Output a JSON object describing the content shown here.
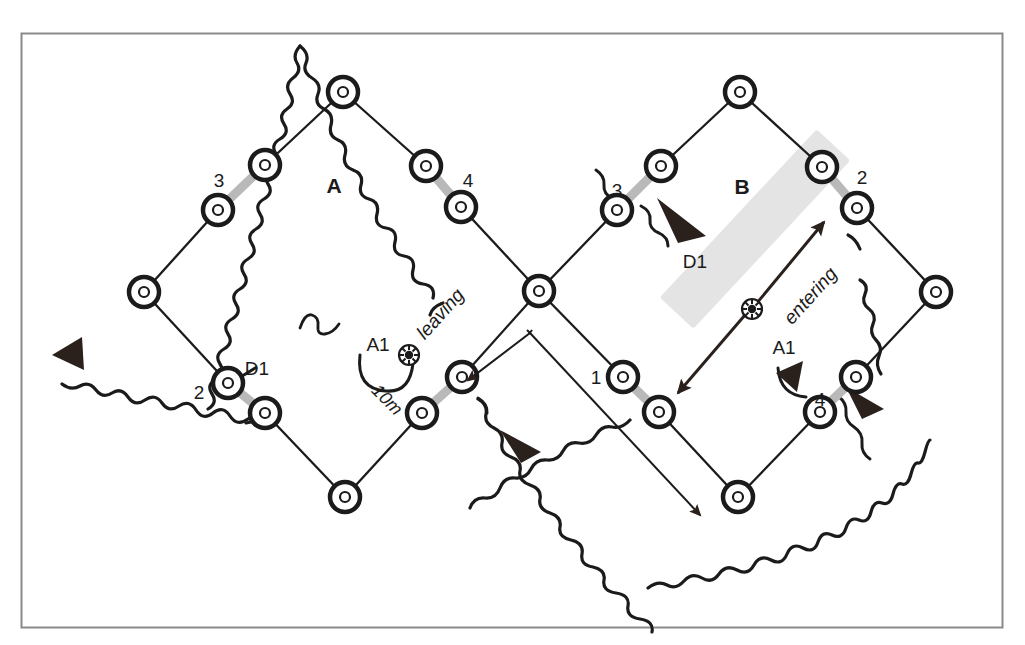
{
  "figure": {
    "frame_color": "#8a8a8a",
    "background": "#ffffff",
    "ink_color": "#1b1b1b",
    "gate_color": "#b9b9b9",
    "band_color": "#e2e2e2"
  },
  "regions": [
    {
      "id": "A",
      "label": "A",
      "x": 334,
      "y": 186
    },
    {
      "id": "B",
      "label": "B",
      "x": 742,
      "y": 187
    }
  ],
  "gate_labels": [
    {
      "label": "3",
      "x": 219,
      "y": 180,
      "region": "A"
    },
    {
      "label": "4",
      "x": 468,
      "y": 180,
      "region": "A"
    },
    {
      "label": "2",
      "x": 199,
      "y": 392,
      "region": "A"
    },
    {
      "label": "3",
      "x": 617,
      "y": 190,
      "region": "B"
    },
    {
      "label": "2",
      "x": 862,
      "y": 177,
      "region": "B"
    },
    {
      "label": "1",
      "x": 596,
      "y": 377,
      "region": "B"
    },
    {
      "label": "4",
      "x": 820,
      "y": 399,
      "region": "B"
    }
  ],
  "annotations": [
    {
      "id": "d1-left",
      "label": "D1",
      "x": 257,
      "y": 368,
      "kind": "departure"
    },
    {
      "id": "d1-right",
      "label": "D1",
      "x": 695,
      "y": 261,
      "kind": "departure"
    },
    {
      "id": "a1-left",
      "label": "A1",
      "x": 378,
      "y": 344,
      "kind": "arrival"
    },
    {
      "id": "a1-right",
      "label": "A1",
      "x": 784,
      "y": 347,
      "kind": "arrival"
    }
  ],
  "flow_labels": [
    {
      "id": "leaving",
      "label": "leaving",
      "x": 445,
      "y": 318,
      "rotation": -48
    },
    {
      "id": "entering",
      "label": "entering",
      "x": 815,
      "y": 300,
      "rotation": -48
    }
  ],
  "scale_bar": {
    "label": "10m",
    "x": 383,
    "y": 404,
    "rotation": 45,
    "from": {
      "x": 530,
      "y": 333
    },
    "to": {
      "x": 700,
      "y": 515
    }
  },
  "chart_data": {
    "type": "diagram",
    "networks": [
      {
        "name": "A",
        "nodes": [
          {
            "id": "a-top",
            "x": 343,
            "y": 92
          },
          {
            "id": "a-nw",
            "x": 265,
            "y": 165
          },
          {
            "id": "a-ne",
            "x": 426,
            "y": 166
          },
          {
            "id": "a-w-upper",
            "x": 218,
            "y": 210
          },
          {
            "id": "a-e-lower",
            "x": 461,
            "y": 207
          },
          {
            "id": "a-w",
            "x": 144,
            "y": 292
          },
          {
            "id": "a-center",
            "x": 539,
            "y": 291
          },
          {
            "id": "a-sw",
            "x": 228,
            "y": 383
          },
          {
            "id": "a-s-left",
            "x": 265,
            "y": 413
          },
          {
            "id": "a-se",
            "x": 462,
            "y": 377
          },
          {
            "id": "a-s-right",
            "x": 422,
            "y": 413
          },
          {
            "id": "a-bottom",
            "x": 345,
            "y": 497
          }
        ],
        "edges": [
          [
            "a-top",
            "a-nw"
          ],
          [
            "a-top",
            "a-ne"
          ],
          [
            "a-w-upper",
            "a-w"
          ],
          [
            "a-e-lower",
            "a-center"
          ],
          [
            "a-w",
            "a-sw"
          ],
          [
            "a-center",
            "a-se"
          ],
          [
            "a-s-left",
            "a-bottom"
          ],
          [
            "a-s-right",
            "a-bottom"
          ]
        ],
        "gates": [
          {
            "label": "3",
            "from": "a-nw",
            "to": "a-w-upper"
          },
          {
            "label": "4",
            "from": "a-ne",
            "to": "a-e-lower"
          },
          {
            "label": "2",
            "from": "a-sw",
            "to": "a-s-left"
          },
          {
            "label": "1",
            "from": "a-se",
            "to": "a-s-right"
          }
        ]
      },
      {
        "name": "B",
        "nodes": [
          {
            "id": "b-top",
            "x": 740,
            "y": 92
          },
          {
            "id": "b-nw",
            "x": 661,
            "y": 166
          },
          {
            "id": "b-ne",
            "x": 822,
            "y": 167
          },
          {
            "id": "b-w-upper",
            "x": 617,
            "y": 210
          },
          {
            "id": "b-e-lower",
            "x": 857,
            "y": 208
          },
          {
            "id": "b-center",
            "x": 539,
            "y": 291
          },
          {
            "id": "b-e",
            "x": 936,
            "y": 292
          },
          {
            "id": "b-sw",
            "x": 623,
            "y": 377
          },
          {
            "id": "b-s-left",
            "x": 659,
            "y": 412
          },
          {
            "id": "b-se",
            "x": 856,
            "y": 377
          },
          {
            "id": "b-s-right",
            "x": 820,
            "y": 412
          },
          {
            "id": "b-bottom",
            "x": 738,
            "y": 497
          }
        ],
        "edges": [
          [
            "b-top",
            "b-nw"
          ],
          [
            "b-top",
            "b-ne"
          ],
          [
            "b-w-upper",
            "b-center"
          ],
          [
            "b-e-lower",
            "b-e"
          ],
          [
            "b-center",
            "b-sw"
          ],
          [
            "b-e",
            "b-se"
          ],
          [
            "b-s-left",
            "b-bottom"
          ],
          [
            "b-s-right",
            "b-bottom"
          ]
        ],
        "gates": [
          {
            "label": "3",
            "from": "b-nw",
            "to": "b-w-upper"
          },
          {
            "label": "2",
            "from": "b-ne",
            "to": "b-e-lower"
          },
          {
            "label": "1",
            "from": "b-sw",
            "to": "b-s-left"
          },
          {
            "label": "4",
            "from": "b-se",
            "to": "b-s-right"
          }
        ]
      }
    ],
    "boundary_arrows": [
      {
        "id": "left-boundary-arrow",
        "x": 66,
        "y": 352,
        "direction": "left"
      },
      {
        "id": "center-boundary-arrow",
        "x": 520,
        "y": 440,
        "direction": "down-right"
      },
      {
        "id": "right-boundary-arrow",
        "x": 866,
        "y": 402,
        "direction": "down-right"
      }
    ],
    "movement_arrows": [
      {
        "id": "d1-arrow-right",
        "label": "D1",
        "direction": "down-right"
      },
      {
        "id": "a1-arrow-right",
        "label": "A1",
        "direction": "up"
      },
      {
        "id": "band-arrow",
        "label": "",
        "direction": "bidirectional-diagonal"
      }
    ],
    "markers": [
      {
        "id": "ball-left",
        "x": 409,
        "y": 355,
        "glyph": "soccer-ball"
      },
      {
        "id": "ball-right",
        "x": 752,
        "y": 309,
        "glyph": "soccer-ball"
      }
    ]
  }
}
